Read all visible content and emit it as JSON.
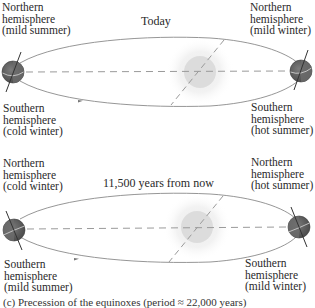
{
  "figure": {
    "panels": [
      {
        "title": "Today",
        "left_earth": {
          "north_label": [
            "Northern",
            "hemisphere",
            "(mild summer)"
          ],
          "south_label": [
            "Southern",
            "hemisphere",
            "(cold winter)"
          ]
        },
        "right_earth": {
          "north_label": [
            "Northern",
            "hemisphere",
            "(mild winter)"
          ],
          "south_label": [
            "Southern",
            "hemisphere",
            "(hot summer)"
          ]
        }
      },
      {
        "title": "11,500 years from now",
        "left_earth": {
          "north_label": [
            "Northern",
            "hemisphere",
            "(cold winter)"
          ],
          "south_label": [
            "Southern",
            "hemisphere",
            "(mild summer)"
          ]
        },
        "right_earth": {
          "north_label": [
            "Northern",
            "hemisphere",
            "(hot summer)"
          ],
          "south_label": [
            "Southern",
            "hemisphere",
            "(mild winter)"
          ]
        }
      }
    ],
    "caption": "(c) Precession of the equinoxes (period ≈ 22,000 years)",
    "colors": {
      "orbit": "#8a8a8a",
      "dash": "#9a9a9a",
      "sun": "#dcdcdc",
      "sun_glow": "#f1f1f1",
      "earth_dark": "#5a5a5a",
      "earth_light": "#7a7a7a",
      "axis": "#333333"
    },
    "icons": [
      "earth-icon",
      "sun-icon",
      "orbit-arrow-icon"
    ]
  }
}
